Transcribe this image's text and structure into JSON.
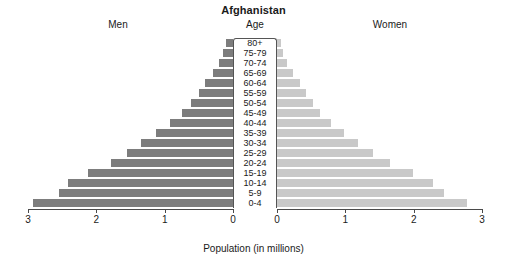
{
  "chart_data": {
    "type": "bar",
    "subtype": "population-pyramid",
    "title": "Afghanistan",
    "xlabel": "Population (in millions)",
    "ylabel": "Age",
    "grid": false,
    "legend_position": "none",
    "left_header": "Men",
    "center_header": "Age",
    "right_header": "Women",
    "xlim_left": [
      3,
      0
    ],
    "xlim_right": [
      0,
      3
    ],
    "xticks_left": [
      "3",
      "2",
      "1",
      "0"
    ],
    "xticks_right": [
      "0",
      "1",
      "2",
      "3"
    ],
    "xtick_values_left": [
      3,
      2,
      1,
      0
    ],
    "xtick_values_right": [
      0,
      1,
      2,
      3
    ],
    "categories": [
      "80+",
      "75-79",
      "70-74",
      "65-69",
      "60-64",
      "55-59",
      "50-54",
      "45-49",
      "40-44",
      "35-39",
      "30-34",
      "25-29",
      "20-24",
      "15-19",
      "10-14",
      "5-9",
      "0-4"
    ],
    "series": [
      {
        "name": "Men",
        "color": "#7d7d7d",
        "values": [
          0.1,
          0.14,
          0.21,
          0.3,
          0.41,
          0.5,
          0.62,
          0.75,
          0.92,
          1.12,
          1.34,
          1.55,
          1.78,
          2.12,
          2.42,
          2.92,
          2.92
        ]
      },
      {
        "name": "Women",
        "color": "#c9c9c9",
        "values": [
          0.06,
          0.09,
          0.15,
          0.24,
          0.33,
          0.42,
          0.52,
          0.63,
          0.79,
          0.98,
          1.19,
          1.4,
          1.66,
          1.99,
          2.28,
          2.78,
          2.78
        ]
      }
    ],
    "series_men": {
      "name": "Men",
      "color": "#7d7d7d",
      "points": [
        {
          "age": "80+",
          "value": 0.1
        },
        {
          "age": "75-79",
          "value": 0.14
        },
        {
          "age": "70-74",
          "value": 0.21
        },
        {
          "age": "65-69",
          "value": 0.3
        },
        {
          "age": "60-64",
          "value": 0.41
        },
        {
          "age": "55-59",
          "value": 0.5
        },
        {
          "age": "50-54",
          "value": 0.62
        },
        {
          "age": "45-49",
          "value": 0.75
        },
        {
          "age": "40-44",
          "value": 0.92
        },
        {
          "age": "35-39",
          "value": 1.12
        },
        {
          "age": "30-34",
          "value": 1.34
        },
        {
          "age": "25-29",
          "value": 1.55
        },
        {
          "age": "20-24",
          "value": 1.78
        },
        {
          "age": "15-19",
          "value": 2.12
        },
        {
          "age": "10-14",
          "value": 2.42
        },
        {
          "age": "5-9",
          "value": 2.55
        },
        {
          "age": "0-4",
          "value": 2.92
        }
      ]
    },
    "series_women": {
      "name": "Women",
      "color": "#c9c9c9",
      "points": [
        {
          "age": "80+",
          "value": 0.06
        },
        {
          "age": "75-79",
          "value": 0.09
        },
        {
          "age": "70-74",
          "value": 0.15
        },
        {
          "age": "65-69",
          "value": 0.24
        },
        {
          "age": "60-64",
          "value": 0.33
        },
        {
          "age": "55-59",
          "value": 0.42
        },
        {
          "age": "50-54",
          "value": 0.52
        },
        {
          "age": "45-49",
          "value": 0.63
        },
        {
          "age": "40-44",
          "value": 0.79
        },
        {
          "age": "35-39",
          "value": 0.98
        },
        {
          "age": "30-34",
          "value": 1.19
        },
        {
          "age": "25-29",
          "value": 1.4
        },
        {
          "age": "20-24",
          "value": 1.66
        },
        {
          "age": "15-19",
          "value": 1.99
        },
        {
          "age": "10-14",
          "value": 2.28
        },
        {
          "age": "5-9",
          "value": 2.45
        },
        {
          "age": "0-4",
          "value": 2.78
        }
      ]
    }
  }
}
